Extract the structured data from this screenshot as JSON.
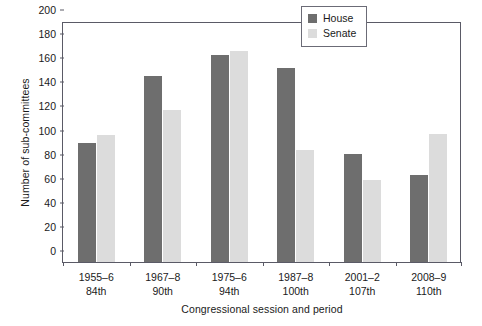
{
  "chart_data": {
    "type": "bar",
    "title": "",
    "xlabel": "Congressional session and period",
    "ylabel": "Number of sub-committees",
    "categories": [
      "1955–6\n84th",
      "1967–8\n90th",
      "1975–6\n94th",
      "1987–8\n100th",
      "2001–2\n107th",
      "2008–9\n110th"
    ],
    "category_lines": [
      {
        "period": "1955–6",
        "session": "84th"
      },
      {
        "period": "1967–8",
        "session": "90th"
      },
      {
        "period": "1975–6",
        "session": "94th"
      },
      {
        "period": "1987–8",
        "session": "100th"
      },
      {
        "period": "2001–2",
        "session": "107th"
      },
      {
        "period": "2008–9",
        "session": "110th"
      }
    ],
    "series": [
      {
        "name": "House",
        "color": "#6e6e6e",
        "values": [
          99,
          154,
          172,
          161,
          90,
          72
        ]
      },
      {
        "name": "Senate",
        "color": "#dcdcdc",
        "values": [
          105,
          126,
          175,
          93,
          68,
          106
        ]
      }
    ],
    "ylim": [
      0,
      200
    ],
    "ytick_step": 20,
    "yticks": [
      0,
      20,
      40,
      60,
      80,
      100,
      120,
      140,
      160,
      180,
      200
    ],
    "grid": false,
    "legend_position": "top-right",
    "legend_entries": [
      "House",
      "Senate"
    ]
  },
  "colors": {
    "house": "#6e6e6e",
    "senate": "#dcdcdc",
    "axis": "#5a5a66",
    "text": "#1a1a1a",
    "background": "#ffffff"
  }
}
